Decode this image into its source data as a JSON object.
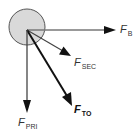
{
  "diagram": {
    "body": {
      "shape": "circle",
      "fill": "#d9d9d9",
      "stroke": "#555555"
    },
    "forces": [
      {
        "id": "b",
        "symbol": "F",
        "subscript": "B",
        "direction": "right",
        "color": "#777777"
      },
      {
        "id": "sec",
        "symbol": "F",
        "subscript": "SEC",
        "direction": "down-right shallow",
        "color": "#444444"
      },
      {
        "id": "to",
        "symbol": "F",
        "subscript": "TO",
        "direction": "down-right steep",
        "color": "#111111",
        "emphasis": "bold"
      },
      {
        "id": "pri",
        "symbol": "F",
        "subscript": "PRI",
        "direction": "down",
        "color": "#444444"
      }
    ]
  }
}
